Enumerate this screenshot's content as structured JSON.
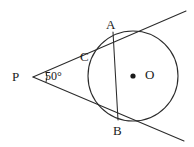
{
  "figure": {
    "stroke_color": "#2b2b2b",
    "fill_color": "#ffffff",
    "label_color": "#1a1a1a",
    "canvas": {
      "width": 194,
      "height": 147
    }
  },
  "labels": {
    "external_point": "P",
    "tangent_point_upper": "A",
    "tangent_point_lower": "B",
    "chord_circle_intersection": "C",
    "circle_center": "O",
    "angle_measure": "50°"
  },
  "geometry": {
    "circle": {
      "cx": 133,
      "cy": 76,
      "r": 45
    },
    "center_dot": {
      "cx": 133,
      "cy": 76,
      "r": 2.6
    },
    "points": {
      "P": {
        "x": 33,
        "y": 77
      },
      "A": {
        "x": 113,
        "y": 32
      },
      "B": {
        "x": 118,
        "y": 120
      },
      "C": {
        "x": 90,
        "y": 58
      }
    },
    "tangent_upper": {
      "x1": 33,
      "y1": 77,
      "x2": 186,
      "y2": 11
    },
    "tangent_lower": {
      "x1": 33,
      "y1": 77,
      "x2": 184,
      "y2": 141
    },
    "chord_AB": {
      "x1": 113,
      "y1": 32,
      "x2": 118,
      "y2": 120
    },
    "angle_arc": {
      "cx": 33,
      "cy": 77,
      "r": 14,
      "start_deg": -23.3,
      "end_deg": 23.1
    }
  },
  "chart_data": {
    "type": "diagram",
    "elements": [
      {
        "name": "circle",
        "center": [
          133,
          76
        ],
        "radius": 45
      },
      {
        "name": "point-P",
        "position": [
          33,
          77
        ],
        "role": "external point"
      },
      {
        "name": "point-A",
        "position": [
          113,
          32
        ],
        "role": "upper tangency point"
      },
      {
        "name": "point-B",
        "position": [
          118,
          120
        ],
        "role": "lower tangency point"
      },
      {
        "name": "point-C",
        "position": [
          90,
          58
        ],
        "role": "chord AB meets circle arc"
      },
      {
        "name": "point-O",
        "position": [
          133,
          76
        ],
        "role": "circle center"
      },
      {
        "name": "angle-APB",
        "value": 50,
        "unit": "degrees"
      }
    ]
  }
}
